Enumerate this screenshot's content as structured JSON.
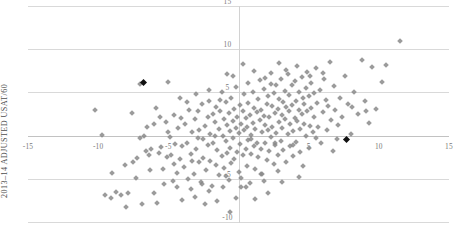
{
  "chart_data": {
    "type": "scatter",
    "title": "",
    "xlabel": "",
    "ylabel": "2013–14 ADJUSTED USAT/60",
    "xlim": [
      -15,
      15
    ],
    "ylim": [
      -10,
      15
    ],
    "grid": true,
    "legend": false,
    "xticks": [
      -15,
      -10,
      -5,
      0,
      5,
      10,
      15
    ],
    "xtick_labels": [
      "-15",
      "-10",
      "-5",
      "",
      "5",
      "10",
      "15"
    ],
    "yticks": [
      -10,
      -5,
      0,
      5,
      10,
      15
    ],
    "ytick_labels": [
      "-10",
      "-5",
      "",
      "5",
      "10",
      "15"
    ],
    "series": [
      {
        "name": "players",
        "color": "#8a8a8a",
        "marker": "diamond",
        "points": [
          [
            -10.2,
            3.0
          ],
          [
            -9.7,
            0.1
          ],
          [
            -9.0,
            -4.3
          ],
          [
            -8.7,
            -6.5
          ],
          [
            -8.4,
            -6.9
          ],
          [
            -8.0,
            -8.3
          ],
          [
            -7.9,
            -6.6
          ],
          [
            -7.6,
            2.6
          ],
          [
            -7.5,
            -3.0
          ],
          [
            -7.3,
            -4.9
          ],
          [
            -7.0,
            6.0
          ],
          [
            -6.7,
            0.0
          ],
          [
            -6.6,
            -1.8
          ],
          [
            -6.4,
            -2.2
          ],
          [
            -6.2,
            -1.6
          ],
          [
            -6.0,
            -6.6
          ],
          [
            -5.9,
            3.2
          ],
          [
            -5.7,
            -2.0
          ],
          [
            -5.5,
            -1.3
          ],
          [
            -5.4,
            -3.9
          ],
          [
            -5.2,
            1.6
          ],
          [
            -5.1,
            -2.5
          ],
          [
            -5.0,
            6.2
          ],
          [
            -4.9,
            -0.2
          ],
          [
            -4.8,
            -2.3
          ],
          [
            -4.7,
            -5.2
          ],
          [
            -4.6,
            2.4
          ],
          [
            -4.5,
            -1.0
          ],
          [
            -4.4,
            -4.3
          ],
          [
            -4.3,
            0.9
          ],
          [
            -4.2,
            -2.7
          ],
          [
            -4.1,
            2.0
          ],
          [
            -4.0,
            -1.2
          ],
          [
            -3.9,
            -3.6
          ],
          [
            -3.8,
            1.3
          ],
          [
            -3.7,
            -0.8
          ],
          [
            -3.6,
            -5.0
          ],
          [
            -3.5,
            3.0
          ],
          [
            -3.4,
            -2.1
          ],
          [
            -3.3,
            0.4
          ],
          [
            -3.2,
            -4.5
          ],
          [
            -3.1,
            1.9
          ],
          [
            -3.0,
            -1.5
          ],
          [
            -2.9,
            2.8
          ],
          [
            -2.8,
            -3.1
          ],
          [
            -2.8,
            0.7
          ],
          [
            -2.7,
            -5.4
          ],
          [
            -2.6,
            3.6
          ],
          [
            -2.5,
            -0.4
          ],
          [
            -2.5,
            -2.6
          ],
          [
            -2.4,
            1.1
          ],
          [
            -2.3,
            -4.0
          ],
          [
            -2.2,
            2.2
          ],
          [
            -2.2,
            -1.1
          ],
          [
            -2.1,
            4.0
          ],
          [
            -2.0,
            -2.9
          ],
          [
            -2.0,
            0.2
          ],
          [
            -1.9,
            -5.8
          ],
          [
            -1.8,
            2.5
          ],
          [
            -1.8,
            -0.9
          ],
          [
            -1.7,
            1.6
          ],
          [
            -1.6,
            -3.4
          ],
          [
            -1.6,
            3.3
          ],
          [
            -1.5,
            -1.7
          ],
          [
            -1.4,
            0.8
          ],
          [
            -1.4,
            -4.6
          ],
          [
            -1.3,
            2.9
          ],
          [
            -1.2,
            -2.4
          ],
          [
            -1.2,
            5.1
          ],
          [
            -1.1,
            0.0
          ],
          [
            -1.0,
            -3.8
          ],
          [
            -1.0,
            1.9
          ],
          [
            -0.9,
            -0.6
          ],
          [
            -0.9,
            3.9
          ],
          [
            -0.8,
            -2.0
          ],
          [
            -0.8,
            1.2
          ],
          [
            -0.7,
            -5.1
          ],
          [
            -0.7,
            2.6
          ],
          [
            -0.6,
            -1.4
          ],
          [
            -0.6,
            0.5
          ],
          [
            -0.5,
            4.4
          ],
          [
            -0.5,
            -3.2
          ],
          [
            -0.4,
            1.7
          ],
          [
            -0.4,
            -0.3
          ],
          [
            -0.3,
            3.1
          ],
          [
            -0.3,
            -2.7
          ],
          [
            -0.2,
            0.9
          ],
          [
            -0.2,
            5.6
          ],
          [
            -0.1,
            -1.9
          ],
          [
            -0.1,
            2.2
          ],
          [
            0.0,
            -4.2
          ],
          [
            0.0,
            0.3
          ],
          [
            0.1,
            3.5
          ],
          [
            0.1,
            -1.0
          ],
          [
            0.2,
            1.4
          ],
          [
            0.2,
            -6.0
          ],
          [
            0.3,
            2.8
          ],
          [
            0.3,
            -2.3
          ],
          [
            0.4,
            0.6
          ],
          [
            0.4,
            4.8
          ],
          [
            0.5,
            -1.6
          ],
          [
            0.5,
            2.0
          ],
          [
            0.6,
            -3.5
          ],
          [
            0.6,
            1.0
          ],
          [
            0.7,
            3.8
          ],
          [
            0.7,
            -0.5
          ],
          [
            0.8,
            -5.5
          ],
          [
            0.8,
            2.4
          ],
          [
            0.9,
            0.1
          ],
          [
            0.9,
            -2.1
          ],
          [
            1.0,
            5.0
          ],
          [
            1.0,
            1.5
          ],
          [
            1.1,
            -1.2
          ],
          [
            1.1,
            3.2
          ],
          [
            1.2,
            -3.9
          ],
          [
            1.2,
            0.8
          ],
          [
            1.3,
            2.7
          ],
          [
            1.3,
            -0.8
          ],
          [
            1.4,
            4.2
          ],
          [
            1.4,
            -2.5
          ],
          [
            1.5,
            1.8
          ],
          [
            1.5,
            6.4
          ],
          [
            1.6,
            -1.5
          ],
          [
            1.6,
            3.0
          ],
          [
            1.7,
            0.4
          ],
          [
            1.7,
            -4.4
          ],
          [
            1.8,
            2.3
          ],
          [
            1.8,
            5.4
          ],
          [
            1.9,
            -0.9
          ],
          [
            1.9,
            1.2
          ],
          [
            2.0,
            3.6
          ],
          [
            2.0,
            -2.8
          ],
          [
            2.1,
            0.7
          ],
          [
            2.1,
            4.6
          ],
          [
            2.2,
            -1.8
          ],
          [
            2.2,
            2.1
          ],
          [
            2.3,
            6.0
          ],
          [
            2.3,
            -0.2
          ],
          [
            2.4,
            3.4
          ],
          [
            2.4,
            1.0
          ],
          [
            2.5,
            -3.3
          ],
          [
            2.5,
            4.9
          ],
          [
            2.6,
            2.6
          ],
          [
            2.6,
            -1.1
          ],
          [
            2.7,
            0.3
          ],
          [
            2.7,
            5.8
          ],
          [
            2.8,
            3.1
          ],
          [
            2.8,
            -2.2
          ],
          [
            2.9,
            1.6
          ],
          [
            2.9,
            4.2
          ],
          [
            3.0,
            -0.6
          ],
          [
            3.0,
            6.6
          ],
          [
            3.1,
            2.4
          ],
          [
            3.1,
            0.9
          ],
          [
            3.2,
            3.9
          ],
          [
            3.2,
            -1.7
          ],
          [
            3.3,
            5.2
          ],
          [
            3.3,
            1.9
          ],
          [
            3.4,
            -3.0
          ],
          [
            3.4,
            3.3
          ],
          [
            3.5,
            0.2
          ],
          [
            3.5,
            7.1
          ],
          [
            3.6,
            2.8
          ],
          [
            3.6,
            4.7
          ],
          [
            3.7,
            -1.2
          ],
          [
            3.7,
            1.3
          ],
          [
            3.8,
            5.9
          ],
          [
            3.8,
            3.5
          ],
          [
            3.9,
            0.5
          ],
          [
            3.9,
            -2.4
          ],
          [
            4.0,
            2.0
          ],
          [
            4.0,
            6.3
          ],
          [
            4.1,
            4.0
          ],
          [
            4.1,
            -0.7
          ],
          [
            4.2,
            1.7
          ],
          [
            4.2,
            8.1
          ],
          [
            4.3,
            3.0
          ],
          [
            4.3,
            5.0
          ],
          [
            4.4,
            -1.9
          ],
          [
            4.4,
            0.8
          ],
          [
            4.5,
            2.5
          ],
          [
            4.5,
            6.8
          ],
          [
            4.6,
            4.3
          ],
          [
            4.6,
            -3.5
          ],
          [
            4.7,
            1.4
          ],
          [
            4.7,
            3.7
          ],
          [
            4.8,
            5.5
          ],
          [
            4.8,
            0.0
          ],
          [
            4.9,
            2.9
          ],
          [
            4.9,
            7.4
          ],
          [
            5.0,
            4.6
          ],
          [
            5.0,
            -1.4
          ],
          [
            5.1,
            1.1
          ],
          [
            5.2,
            3.2
          ],
          [
            5.2,
            6.1
          ],
          [
            5.3,
            0.4
          ],
          [
            5.4,
            4.9
          ],
          [
            5.4,
            2.2
          ],
          [
            5.5,
            7.8
          ],
          [
            5.6,
            3.8
          ],
          [
            5.7,
            1.0
          ],
          [
            5.8,
            5.3
          ],
          [
            5.9,
            -0.9
          ],
          [
            6.0,
            2.7
          ],
          [
            6.1,
            6.5
          ],
          [
            6.2,
            4.1
          ],
          [
            6.3,
            0.6
          ],
          [
            6.4,
            3.4
          ],
          [
            6.5,
            8.5
          ],
          [
            6.6,
            1.8
          ],
          [
            6.8,
            5.7
          ],
          [
            6.9,
            3.0
          ],
          [
            7.0,
            -0.4
          ],
          [
            7.2,
            4.4
          ],
          [
            7.4,
            2.1
          ],
          [
            7.6,
            6.9
          ],
          [
            7.8,
            3.6
          ],
          [
            8.0,
            0.2
          ],
          [
            8.2,
            5.0
          ],
          [
            8.5,
            2.5
          ],
          [
            8.8,
            8.8
          ],
          [
            9.0,
            4.0
          ],
          [
            9.3,
            1.5
          ],
          [
            9.5,
            7.9
          ],
          [
            9.8,
            3.1
          ],
          [
            10.2,
            6.2
          ],
          [
            10.5,
            8.2
          ],
          [
            11.5,
            11.0
          ],
          [
            -1.5,
            -7.6
          ],
          [
            -0.2,
            -7.2
          ],
          [
            1.2,
            -7.3
          ],
          [
            2.1,
            -6.6
          ],
          [
            -3.1,
            -7.1
          ],
          [
            -4.0,
            -7.4
          ],
          [
            -5.8,
            -7.8
          ],
          [
            -6.9,
            -7.9
          ],
          [
            -0.6,
            -8.9
          ],
          [
            -2.4,
            -7.9
          ],
          [
            -6.3,
            -4.0
          ],
          [
            -5.3,
            -5.6
          ],
          [
            -4.4,
            -6.0
          ],
          [
            -3.4,
            -6.2
          ],
          [
            -2.1,
            -6.4
          ],
          [
            -1.1,
            -6.0
          ],
          [
            0.5,
            -5.9
          ],
          [
            1.8,
            -5.2
          ],
          [
            3.1,
            -5.4
          ],
          [
            4.3,
            -4.8
          ],
          [
            -0.9,
            -4.7
          ],
          [
            0.2,
            -4.9
          ],
          [
            1.6,
            -4.5
          ],
          [
            2.8,
            -4.1
          ],
          [
            -2.6,
            -5.6
          ],
          [
            -7.2,
            -2.6
          ],
          [
            -8.1,
            -3.4
          ],
          [
            -6.0,
            1.4
          ],
          [
            -5.6,
            2.2
          ],
          [
            -4.2,
            4.3
          ],
          [
            -3.0,
            4.8
          ],
          [
            -2.1,
            5.3
          ],
          [
            -1.3,
            4.1
          ],
          [
            -0.4,
            6.9
          ],
          [
            0.7,
            6.1
          ],
          [
            1.1,
            7.5
          ],
          [
            2.3,
            7.2
          ],
          [
            2.9,
            8.4
          ],
          [
            3.4,
            7.6
          ],
          [
            0.3,
            8.3
          ],
          [
            -0.8,
            7.1
          ],
          [
            1.9,
            6.7
          ],
          [
            5.1,
            6.9
          ],
          [
            6.0,
            7.3
          ],
          [
            -9.5,
            -6.9
          ],
          [
            -9.1,
            -7.2
          ],
          [
            -7.0,
            -0.3
          ],
          [
            -6.5,
            1.0
          ],
          [
            -5.0,
            0.4
          ],
          [
            -3.7,
            3.9
          ],
          [
            6.7,
            -1.8
          ],
          [
            7.1,
            1.2
          ],
          [
            8.1,
            3.3
          ],
          [
            9.1,
            2.8
          ],
          [
            -2.9,
            -0.3
          ],
          [
            -1.7,
            -0.1
          ],
          [
            0.9,
            -0.4
          ],
          [
            2.6,
            -0.9
          ],
          [
            3.9,
            -1.1
          ],
          [
            5.5,
            -0.3
          ],
          [
            -4.6,
            -3.3
          ],
          [
            -3.3,
            -2.9
          ]
        ]
      },
      {
        "name": "highlighted",
        "color": "#111111",
        "marker": "diamond",
        "points": [
          [
            -6.8,
            6.1
          ],
          [
            7.7,
            -0.5
          ]
        ]
      }
    ]
  },
  "axes": {
    "y_title": "2013–14 ADJUSTED USAT/60"
  }
}
